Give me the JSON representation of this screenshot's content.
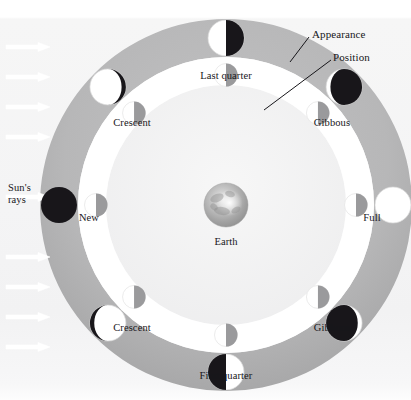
{
  "figure": {
    "title_visible": false,
    "background": "#f4f4f5",
    "paper": "#ffffff"
  },
  "colors": {
    "outer_ring": "#b9b9ba",
    "outer_ring_shadow": "#a9a9aa",
    "mid_band": "#ffffff",
    "inner_disc": "#f2f2f2",
    "moon_lit": "#ffffff",
    "moon_dark": "#18161a",
    "moon_position_dark": "#9a9a9c",
    "earth_base": "#b4b4b4",
    "line": "#17161a",
    "arrow": "#ffffff",
    "text": "#17161a"
  },
  "geometry": {
    "center_x": 226,
    "center_y": 205,
    "outer_ring_outer_r": 186,
    "outer_ring_inner_r": 148,
    "mid_band_outer_r": 148,
    "mid_band_inner_r": 120,
    "inner_disc_r": 120,
    "appearance_moon_r": 18,
    "position_moon_r": 11.5,
    "earth_r": 22
  },
  "center_body": {
    "name": "Earth",
    "label": "Earth",
    "label_x": 226,
    "label_y": 236
  },
  "sun": {
    "label_line1": "Sun's",
    "label_line2": "rays",
    "label_x": 8,
    "label_y": 182,
    "direction": "left-to-right",
    "ray_count": 8,
    "ray_ys": [
      47,
      77,
      107,
      137,
      197,
      257,
      287,
      317,
      347
    ],
    "ray_x_start": 6,
    "ray_length": 44
  },
  "callouts": [
    {
      "name": "appearance",
      "label": "Appearance",
      "text_x": 312,
      "text_y": 28,
      "line_x1": 309,
      "line_y1": 37,
      "line_x2": 290,
      "line_y2": 62
    },
    {
      "name": "position",
      "label": "Position",
      "text_x": 333,
      "text_y": 51,
      "line_x1": 331,
      "line_y1": 60,
      "line_x2": 264,
      "line_y2": 110
    }
  ],
  "phases": [
    {
      "id": "new",
      "label": "New",
      "angle_deg": 180,
      "appearance": "full-dark",
      "lit_fraction": 0.0,
      "lit_side": "none",
      "label_x": 89,
      "label_y": 212,
      "label_anchor": "center"
    },
    {
      "id": "crescent-waxing",
      "label": "Crescent",
      "angle_deg": 135,
      "appearance": "crescent-lit-left",
      "lit_fraction": 0.12,
      "lit_side": "left",
      "label_x": 132,
      "label_y": 117,
      "label_anchor": "center"
    },
    {
      "id": "last-quarter",
      "label": "Last quarter",
      "angle_deg": 90,
      "appearance": "half-lit-left",
      "lit_fraction": 0.5,
      "lit_side": "left",
      "label_x": 226,
      "label_y": 70,
      "label_anchor": "center"
    },
    {
      "id": "gibbous-waning",
      "label": "Gibbous",
      "angle_deg": 45,
      "appearance": "gibbous-lit-left",
      "lit_fraction": 0.88,
      "lit_side": "left",
      "label_x": 332,
      "label_y": 117,
      "label_anchor": "center"
    },
    {
      "id": "full",
      "label": "Full",
      "angle_deg": 0,
      "appearance": "full-lit",
      "lit_fraction": 1.0,
      "lit_side": "all",
      "label_x": 372,
      "label_y": 212,
      "label_anchor": "center"
    },
    {
      "id": "gibbous-waxing",
      "label": "Gibbous",
      "angle_deg": -45,
      "appearance": "gibbous-lit-right",
      "lit_fraction": 0.88,
      "lit_side": "right",
      "label_x": 332,
      "label_y": 322,
      "label_anchor": "center"
    },
    {
      "id": "first-quarter",
      "label": "First quarter",
      "angle_deg": -90,
      "appearance": "half-lit-right",
      "lit_fraction": 0.5,
      "lit_side": "right",
      "label_x": 226,
      "label_y": 370,
      "label_anchor": "center"
    },
    {
      "id": "crescent-waning",
      "label": "Crescent",
      "angle_deg": -135,
      "appearance": "crescent-lit-right",
      "lit_fraction": 0.12,
      "lit_side": "right",
      "label_x": 132,
      "label_y": 322,
      "label_anchor": "center"
    }
  ],
  "position_markers": [
    {
      "id": "pos-new",
      "angle_deg": 180
    },
    {
      "id": "pos-crescent-waxing",
      "angle_deg": 135
    },
    {
      "id": "pos-last-quarter",
      "angle_deg": 90
    },
    {
      "id": "pos-gibbous-waning",
      "angle_deg": 45
    },
    {
      "id": "pos-full",
      "angle_deg": 0
    },
    {
      "id": "pos-gibbous-waxing",
      "angle_deg": -45
    },
    {
      "id": "pos-first-quarter",
      "angle_deg": -90
    },
    {
      "id": "pos-crescent-waning",
      "angle_deg": -135
    }
  ]
}
